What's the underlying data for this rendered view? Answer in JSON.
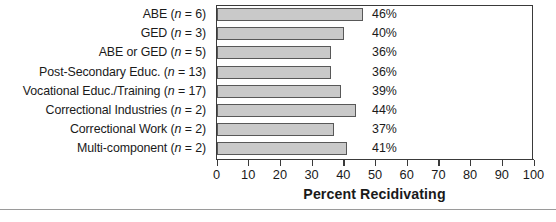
{
  "chart_data": {
    "type": "bar",
    "orientation": "horizontal",
    "title": "",
    "xlabel": "Percent Recidivating",
    "ylabel": "",
    "xlim": [
      0,
      100
    ],
    "xticks": [
      "0",
      "10",
      "20",
      "30",
      "40",
      "50",
      "60",
      "70",
      "80",
      "90",
      "100"
    ],
    "grid": false,
    "legend": null,
    "categories": [
      "ABE (n = 6)",
      "GED (n = 3)",
      "ABE or GED (n = 5)",
      "Post-Secondary Educ. (n = 13)",
      "Vocational Educ./Training (n = 17)",
      "Correctional Industries (n = 2)",
      "Correctional Work (n = 2)",
      "Multi-component (n = 2)"
    ],
    "values": [
      46,
      40,
      36,
      36,
      39,
      44,
      37,
      41
    ],
    "data_labels": [
      "46%",
      "40%",
      "36%",
      "36%",
      "39%",
      "44%",
      "37%",
      "41%"
    ],
    "bars": [
      {
        "label_main": "ABE ",
        "label_n": "n",
        "label_tail": " = 6)",
        "value": 46,
        "data_label": "46%"
      },
      {
        "label_main": "GED ",
        "label_n": "n",
        "label_tail": " = 3)",
        "value": 40,
        "data_label": "40%"
      },
      {
        "label_main": "ABE or GED ",
        "label_n": "n",
        "label_tail": " = 5)",
        "value": 36,
        "data_label": "36%"
      },
      {
        "label_main": "Post-Secondary Educ. ",
        "label_n": "n",
        "label_tail": " = 13)",
        "value": 36,
        "data_label": "36%"
      },
      {
        "label_main": "Vocational Educ./Training ",
        "label_n": "n",
        "label_tail": " = 17)",
        "value": 39,
        "data_label": "39%"
      },
      {
        "label_main": "Correctional Industries ",
        "label_n": "n",
        "label_tail": " = 2)",
        "value": 44,
        "data_label": "44%"
      },
      {
        "label_main": "Correctional Work ",
        "label_n": "n",
        "label_tail": " = 2)",
        "value": 37,
        "data_label": "37%"
      },
      {
        "label_main": "Multi-component ",
        "label_n": "n",
        "label_tail": " = 2)",
        "value": 41,
        "data_label": "41%"
      }
    ],
    "colors": {
      "bar_fill": "#c9c9c9",
      "bar_border": "#585858",
      "axis": "#3a3a3a",
      "text": "#1a1a1a",
      "background": "#ffffff"
    }
  }
}
